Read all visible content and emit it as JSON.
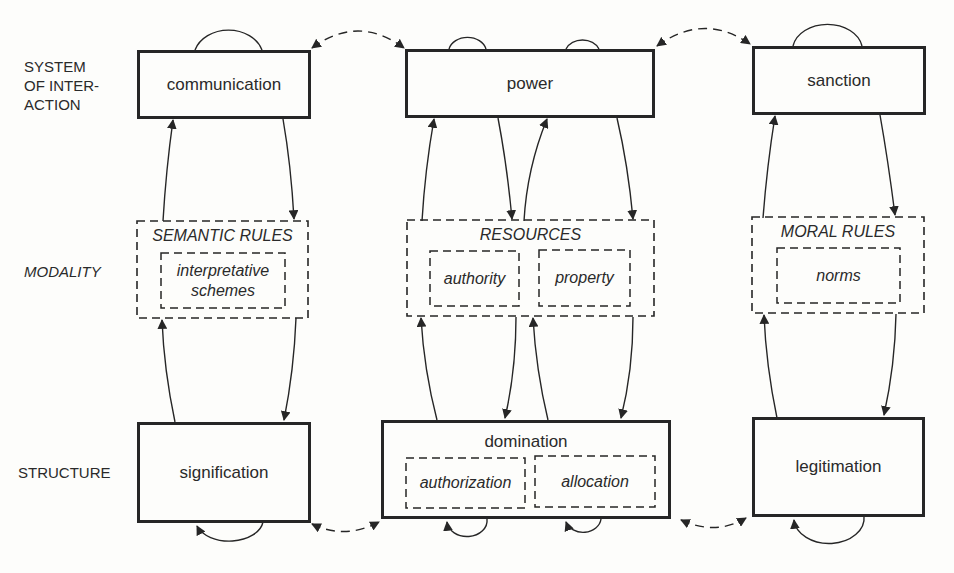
{
  "diagram": {
    "row_labels": {
      "system_of_interaction": [
        "SYSTEM",
        "OF INTER-",
        "ACTION"
      ],
      "modality": "MODALITY",
      "structure": "STRUCTURE"
    },
    "interaction": {
      "communication": "communication",
      "power": "power",
      "sanction": "sanction"
    },
    "modality": {
      "semantic_rules": {
        "title": "SEMANTIC RULES",
        "inner": [
          "interpretative",
          "schemes"
        ]
      },
      "resources": {
        "title": "RESOURCES",
        "inner_left": "authority",
        "inner_right": "property"
      },
      "moral_rules": {
        "title": "MORAL RULES",
        "inner": "norms"
      }
    },
    "structure": {
      "signification": "signification",
      "domination": {
        "title": "domination",
        "inner_left": "authorization",
        "inner_right": "allocation"
      },
      "legitimation": "legitimation"
    },
    "colors": {
      "ink": "#262626",
      "background": "#fdfdfb"
    }
  }
}
